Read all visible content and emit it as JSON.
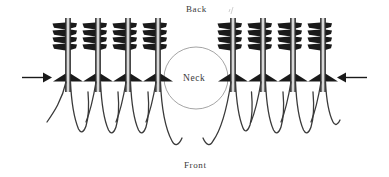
{
  "figure": {
    "title": "",
    "background_color": "#ffffff",
    "ink_color": "#1a1a1a",
    "outline_color": "#4a4a4a",
    "neck_outline_color": "#8a8a8a",
    "width": 389,
    "height": 177
  },
  "labels": {
    "back": "Back",
    "front": "Front",
    "neck": "Neck"
  },
  "arrows": {
    "left": {
      "name": "left-pressure-arrow",
      "direction": "right",
      "x": 22,
      "y": 77,
      "length": 28
    },
    "right": {
      "name": "right-pressure-arrow",
      "direction": "left",
      "x": 339,
      "y": 77,
      "length": 28
    }
  },
  "neck_ellipse": {
    "cx": 196,
    "cy": 78,
    "rx": 32,
    "ry": 31
  },
  "follicle_geometry": {
    "stem_top_y": 18,
    "barb_zone_top": 22,
    "barb_zone_bottom": 50,
    "wing_y": 78,
    "tail_bottom_y": 140,
    "fletch_rows": 4,
    "count_left": 4,
    "count_right": 4
  },
  "follicles_left": [
    {
      "name": "follicle-l1",
      "x": 68,
      "tail_curve_dx": -22,
      "tail_depth": 48
    },
    {
      "name": "follicle-l2",
      "x": 98,
      "tail_curve_dx": -20,
      "tail_depth": 52
    },
    {
      "name": "follicle-l3",
      "x": 128,
      "tail_curve_dx": -20,
      "tail_depth": 52
    },
    {
      "name": "follicle-l4",
      "x": 158,
      "tail_curve_dx": -22,
      "tail_depth": 62
    }
  ],
  "follicles_right": [
    {
      "name": "follicle-r1",
      "x": 233,
      "tail_curve_dx": -24,
      "tail_depth": 62
    },
    {
      "name": "follicle-r2",
      "x": 263,
      "tail_curve_dx": -20,
      "tail_depth": 52
    },
    {
      "name": "follicle-r3",
      "x": 293,
      "tail_curve_dx": -20,
      "tail_depth": 52
    },
    {
      "name": "follicle-r4",
      "x": 323,
      "tail_curve_dx": -20,
      "tail_depth": 48
    }
  ],
  "tick_mark": {
    "name": "stray-tick-mark",
    "x": 231,
    "y": 8
  }
}
